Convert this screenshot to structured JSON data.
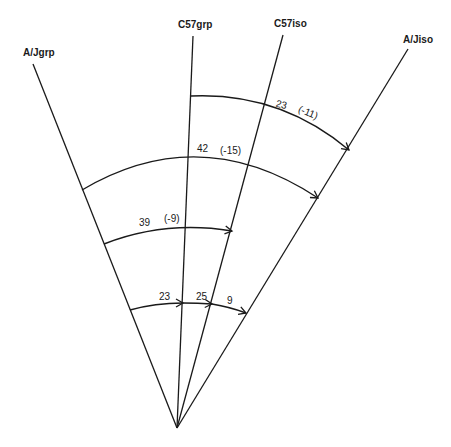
{
  "diagram": {
    "rays": [
      {
        "id": "ajgrp",
        "label": "A/Jgrp"
      },
      {
        "id": "c57grp",
        "label": "C57grp"
      },
      {
        "id": "c57iso",
        "label": "C57iso"
      },
      {
        "id": "ajiso",
        "label": "A/Jiso"
      }
    ],
    "arcs": [
      {
        "id": "arc-top",
        "from": "C57grp",
        "to": "A/Jiso",
        "value": "23",
        "change": "(-11)"
      },
      {
        "id": "arc-second",
        "from": "A/Jgrp",
        "to": "A/Jiso",
        "value": "42",
        "change": "(-15)"
      },
      {
        "id": "arc-third",
        "from": "A/Jgrp",
        "to": "C57iso",
        "value": "39",
        "change": "(-9)"
      },
      {
        "id": "arc-bottom",
        "segments": [
          {
            "from": "A/Jgrp",
            "to": "C57grp",
            "value": "23"
          },
          {
            "from": "C57grp",
            "to": "C57iso",
            "value": "25"
          },
          {
            "from": "C57iso",
            "to": "A/Jiso",
            "value": "9"
          }
        ]
      }
    ],
    "colors": {
      "line": "#1a1a1a",
      "background": "#ffffff"
    }
  }
}
